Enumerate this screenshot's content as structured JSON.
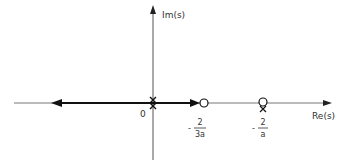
{
  "diagram": {
    "type": "root-locus",
    "axes": {
      "imag_label": "Im(s)",
      "real_label": "Re(s)",
      "origin_label": "0"
    },
    "markers": [
      {
        "kind": "pole",
        "symbol": "x",
        "location": "0",
        "count": 2
      },
      {
        "kind": "zero",
        "symbol": "o",
        "location": "-2/(3a)"
      },
      {
        "kind": "zero",
        "symbol": "o",
        "location": "-2/a"
      },
      {
        "kind": "pole",
        "symbol": "x",
        "location": "-2/a"
      }
    ],
    "tick_labels": [
      {
        "sign": "-",
        "numerator": "2",
        "denominator": "3a"
      },
      {
        "sign": "-",
        "numerator": "2",
        "denominator": "a"
      }
    ],
    "branches": [
      {
        "from": "0",
        "to": "-infinity",
        "direction": "left"
      },
      {
        "from": "0",
        "to": "-2/(3a)",
        "direction": "right"
      }
    ]
  }
}
